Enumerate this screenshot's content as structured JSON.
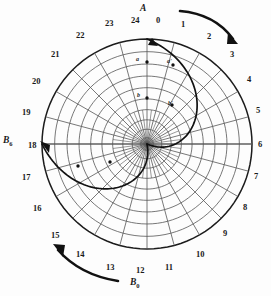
{
  "figure": {
    "type": "polar-spiral-diagram",
    "title_top": "A",
    "label_bottom": "B",
    "label_bottom_sub": "0",
    "label_left": "B",
    "label_left_sub": "6",
    "center": {
      "x": 147,
      "y": 144
    },
    "outer_radius": 105,
    "sector_count": 24,
    "ring_count": 10
  },
  "hour_labels": [
    {
      "text": "0",
      "x": 156,
      "y": 16
    },
    {
      "text": "1",
      "x": 181,
      "y": 20
    },
    {
      "text": "2",
      "x": 207,
      "y": 32
    },
    {
      "text": "3",
      "x": 230,
      "y": 50
    },
    {
      "text": "4",
      "x": 247,
      "y": 75
    },
    {
      "text": "5",
      "x": 256,
      "y": 106
    },
    {
      "text": "6",
      "x": 258,
      "y": 140
    },
    {
      "text": "7",
      "x": 254,
      "y": 172
    },
    {
      "text": "8",
      "x": 243,
      "y": 203
    },
    {
      "text": "9",
      "x": 223,
      "y": 229
    },
    {
      "text": "10",
      "x": 196,
      "y": 250
    },
    {
      "text": "11",
      "x": 165,
      "y": 263
    },
    {
      "text": "12",
      "x": 136,
      "y": 266
    },
    {
      "text": "13",
      "x": 106,
      "y": 263
    },
    {
      "text": "14",
      "x": 76,
      "y": 250
    },
    {
      "text": "15",
      "x": 51,
      "y": 231
    },
    {
      "text": "16",
      "x": 33,
      "y": 204
    },
    {
      "text": "17",
      "x": 22,
      "y": 173
    },
    {
      "text": "18",
      "x": 28,
      "y": 141
    },
    {
      "text": "19",
      "x": 22,
      "y": 108
    },
    {
      "text": "20",
      "x": 32,
      "y": 77
    },
    {
      "text": "21",
      "x": 51,
      "y": 50
    },
    {
      "text": "22",
      "x": 76,
      "y": 31
    },
    {
      "text": "23",
      "x": 105,
      "y": 19
    },
    {
      "text": "24",
      "x": 131,
      "y": 16
    }
  ],
  "point_labels": [
    {
      "text": "a",
      "x": 136,
      "y": 56,
      "px": 147,
      "py": 62
    },
    {
      "text": "a'",
      "x": 167,
      "y": 58,
      "px": 173,
      "py": 65
    },
    {
      "text": "b",
      "x": 137,
      "y": 92,
      "px": 147,
      "py": 98
    },
    {
      "text": "b'",
      "x": 168,
      "y": 100,
      "px": 172,
      "py": 105
    }
  ],
  "spiral_points_left": [
    {
      "px": 78,
      "py": 166
    },
    {
      "px": 110,
      "py": 162
    }
  ],
  "arrows": {
    "outer_top_right": "clockwise-sweep",
    "outer_bottom_left": "counterclockwise-sweep",
    "spiral_top": "arrowhead-up",
    "spiral_left": "arrowhead-left"
  },
  "colors": {
    "grid": "#555555",
    "outline": "#1c1c1c",
    "spiral": "#111111",
    "text": "#1a1a1a",
    "background": "#fdfdfd"
  }
}
